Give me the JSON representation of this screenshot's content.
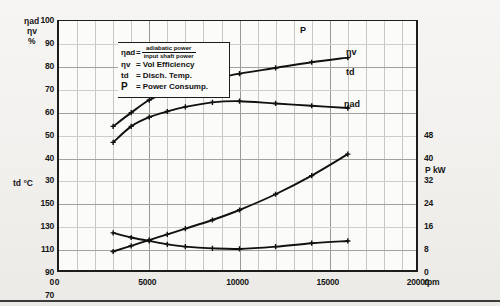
{
  "legend": {
    "rows": [
      {
        "symbol": "ηad",
        "eq": "=",
        "numerator": "adiabatic power",
        "denominator": "input shaft power"
      },
      {
        "symbol": "ηv",
        "eq": "=",
        "text": "Vol Efficiency"
      },
      {
        "symbol": "td",
        "eq": "=",
        "text": "Disch. Temp."
      },
      {
        "symbol": "P",
        "eq": "=",
        "text": "Power Consump."
      }
    ]
  },
  "axes": {
    "left_efficiency_title_1": "ηad",
    "left_efficiency_title_2": "ηv",
    "left_efficiency_unit": "%",
    "left_temp_title": "td °C",
    "right_power_title": "P kW",
    "x_unit": "RPM",
    "eff_ticks": [
      "100",
      "90",
      "80",
      "70",
      "60",
      "50",
      "40",
      "30"
    ],
    "temp_ticks": [
      "150",
      "130",
      "110",
      "90",
      "70"
    ],
    "power_ticks": [
      "48",
      "40",
      "32",
      "24",
      "16",
      "8",
      "0"
    ],
    "x_ticks": [
      "0",
      "5000",
      "10000",
      "15000",
      "20000"
    ],
    "x_zero_left": "0",
    "x_zero_right": "0"
  },
  "curve_labels": {
    "eta_v": "ηv",
    "eta_ad": "ηad",
    "power": "P",
    "temp": "td"
  },
  "chart_data": {
    "type": "line",
    "title": "",
    "xlabel": "RPM",
    "ylabel": "ηad, ηv %  /  td °C",
    "y2label": "P kW",
    "xlim": [
      0,
      20000
    ],
    "grid": true,
    "legend_position": "inside-top-left",
    "axis_eff": {
      "label": "ηad ηv %",
      "min": 30,
      "max": 100,
      "ticks": [
        30,
        40,
        50,
        60,
        70,
        80,
        90,
        100
      ]
    },
    "axis_temp": {
      "label": "td °C",
      "min": 70,
      "max": 150,
      "ticks": [
        70,
        90,
        110,
        130,
        150
      ]
    },
    "axis_power": {
      "label": "P kW",
      "min": 0,
      "max": 48,
      "ticks": [
        0,
        8,
        16,
        24,
        32,
        40,
        48
      ]
    },
    "series": [
      {
        "name": "ηv",
        "axis": "eff",
        "unit": "%",
        "x": [
          3000,
          4000,
          5000,
          6000,
          7000,
          8500,
          10000,
          12000,
          14000,
          16000
        ],
        "values": [
          54.0,
          60.0,
          65.5,
          69.0,
          71.5,
          74.5,
          77.0,
          79.5,
          82.0,
          84.0
        ]
      },
      {
        "name": "ηad",
        "axis": "eff",
        "unit": "%",
        "x": [
          3000,
          4000,
          5000,
          6000,
          7000,
          8500,
          10000,
          12000,
          14000,
          16000
        ],
        "values": [
          47.0,
          54.0,
          58.0,
          60.5,
          62.5,
          64.5,
          65.0,
          64.0,
          63.0,
          62.0
        ]
      },
      {
        "name": "P",
        "axis": "power",
        "unit": "kW",
        "x": [
          3000,
          4000,
          5000,
          6000,
          7000,
          8500,
          10000,
          12000,
          14000,
          16000
        ],
        "values": [
          7.5,
          9.5,
          11.5,
          13.5,
          15.5,
          18.5,
          22.0,
          27.5,
          34.0,
          41.5
        ]
      },
      {
        "name": "td",
        "axis": "temp",
        "unit": "°C",
        "x": [
          3000,
          4000,
          5000,
          6000,
          7000,
          8500,
          10000,
          12000,
          14000,
          16000
        ],
        "values": [
          125.0,
          121.0,
          118.0,
          115.0,
          113.0,
          111.5,
          111.0,
          113.0,
          116.0,
          118.0
        ]
      }
    ]
  }
}
